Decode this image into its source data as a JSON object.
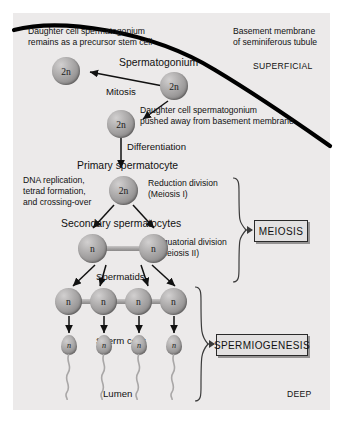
{
  "figure": {
    "panel_bg": "#eceaea",
    "membrane_color": "#000000",
    "cell_color": "#9e9c9c"
  },
  "labels": {
    "daughter_stem_line1": "Daughter cell spermatogonium",
    "daughter_stem_line2": "remains as a precursor stem cell",
    "basement_line1": "Basement membrane",
    "basement_line2": "of seminiferous tubule",
    "superficial": "SUPERFICIAL",
    "deep": "DEEP",
    "spermatogonium": "Spermatogonium",
    "mitosis": "Mitosis",
    "daughter_pushed_line1": "Daughter cell spermatogonium",
    "daughter_pushed_line2": "pushed away from basement membrane",
    "differentiation": "Differentiation",
    "primary_spermatocyte": "Primary spermatocyte",
    "dna_line1": "DNA replication,",
    "dna_line2": "tetrad formation,",
    "dna_line3": "and crossing-over",
    "reduction_line1": "Reduction division",
    "reduction_line2": "(Meiosis I)",
    "secondary_spermatocytes": "Secondary spermatocytes",
    "equatorial_line1": "Equatorial division",
    "equatorial_line2": "(Meiosis II)",
    "spermatids": "Spermatids",
    "sperm_cells": "Sperm cells",
    "lumen": "Lumen",
    "meiosis_box": "MEIOSIS",
    "spermiogenesis_box": "SPERMIOGENESIS"
  },
  "cells": {
    "ploidy_diploid": "2n",
    "ploidy_haploid": "n",
    "stem_cell": "2n",
    "spermatogonium": "2n",
    "daughter_pushed": "2n",
    "primary_spermatocyte": "2n",
    "secondary_spermatocytes": [
      "n",
      "n"
    ],
    "spermatids": [
      "n",
      "n",
      "n",
      "n"
    ],
    "sperm_cells": [
      "n",
      "n",
      "n",
      "n"
    ]
  },
  "stages": [
    {
      "name": "Spermatogonium",
      "ploidy": "2n",
      "count": 1
    },
    {
      "name": "Primary spermatocyte",
      "ploidy": "2n",
      "count": 1
    },
    {
      "name": "Secondary spermatocytes",
      "ploidy": "n",
      "count": 2
    },
    {
      "name": "Spermatids",
      "ploidy": "n",
      "count": 4
    },
    {
      "name": "Sperm cells",
      "ploidy": "n",
      "count": 4
    }
  ]
}
